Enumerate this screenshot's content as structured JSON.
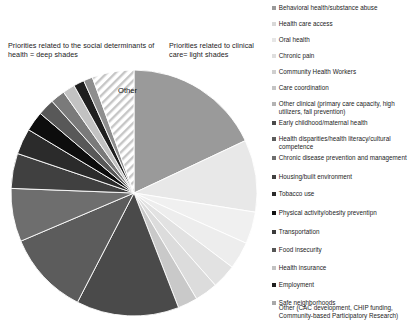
{
  "annotations": {
    "sdoh": "Priorities related to the social determinants of health = deep shades",
    "clinical": "Priorities related to clinical care= light shades"
  },
  "pie": {
    "other_label": "Other",
    "center_x": 134,
    "center_y": 193,
    "radius": 123
  },
  "chart_data": {
    "type": "pie",
    "title": "",
    "legend_position": "right",
    "grid": false,
    "annotations": [
      "Priorities related to the social determinants of health = deep shades",
      "Priorities related to clinical care= light shades"
    ],
    "slice_labels": [
      "Other"
    ],
    "categories": [
      "Behavioral health/substance abuse",
      "Health care access",
      "Oral health",
      "Chronic pain",
      "Community Health Workers",
      "Care coordination",
      "Other clinical (primary care capacity, high utilizers, fall prevention)",
      "Early childhood/maternal health",
      "Health disparities/health literacy/cultural competence",
      "Chronic disease prevention and management",
      "Housing/built environment",
      "Tobacco use",
      "Physical activity/obesity preventipn",
      "Transportation",
      "Food insecurity",
      "Health insurance",
      "Employment",
      "Safe neighborhoods",
      "Other (CAC development, CHIP funding, Community-based Participatory Research)"
    ],
    "values": [
      18.0,
      9.5,
      4.2,
      3.6,
      3.2,
      3.0,
      2.6,
      13.5,
      11.0,
      7.0,
      4.6,
      3.4,
      2.6,
      2.2,
      1.9,
      1.6,
      1.4,
      1.2,
      5.5
    ],
    "colors": [
      "#9a9a9a",
      "#e8e8e8",
      "#f0f0f0",
      "#ededed",
      "#e2e2e2",
      "#dcdcdc",
      "#c9c9c9",
      "#4a4a4a",
      "#5c5c5c",
      "#6e6e6e",
      "#404040",
      "#2b2b2b",
      "#0d0d0d",
      "#585858",
      "#7a7a7a",
      "#c2c2c2",
      "#1f1f1f",
      "#8e8e8e",
      "#ffffff"
    ],
    "hatched_slices": [
      "Other (CAC development, CHIP funding, Community-based Participatory Research)"
    ]
  },
  "legend": {
    "items": [
      {
        "label": "Behavioral health/substance abuse",
        "color": "#9a9a9a",
        "top": 4,
        "hatch": false
      },
      {
        "label": "Health care access",
        "color": "#d8d8d8",
        "top": 20,
        "hatch": false
      },
      {
        "label": "Oral health",
        "color": "#e6e6e6",
        "top": 36,
        "hatch": false
      },
      {
        "label": "Chronic pain",
        "color": "#dedede",
        "top": 52,
        "hatch": false
      },
      {
        "label": "Community Health Workers",
        "color": "#cfcfcf",
        "top": 68,
        "hatch": false
      },
      {
        "label": "Care coordination",
        "color": "#c4c4c4",
        "top": 84,
        "hatch": false
      },
      {
        "label": "Other clinical (primary care capacity, high utilizers, fall prevention)",
        "color": "#b3b3b3",
        "top": 100,
        "hatch": false
      },
      {
        "label": "Early childhood/maternal health",
        "color": "#4a4a4a",
        "top": 119,
        "hatch": false
      },
      {
        "label": "Health disparities/health literacy/cultural competence",
        "color": "#5c5c5c",
        "top": 135,
        "hatch": false
      },
      {
        "label": "Chronic disease prevention and management",
        "color": "#6e6e6e",
        "top": 154,
        "hatch": false
      },
      {
        "label": "Housing/built environment",
        "color": "#404040",
        "top": 173,
        "hatch": false
      },
      {
        "label": "Tobacco use",
        "color": "#2b2b2b",
        "top": 190,
        "hatch": false
      },
      {
        "label": "Physical activity/obesity preventipn",
        "color": "#121212",
        "top": 209,
        "hatch": false
      },
      {
        "label": "Transportation",
        "color": "#3a3a3a",
        "top": 228,
        "hatch": false
      },
      {
        "label": "Food insecurity",
        "color": "#555555",
        "top": 246,
        "hatch": false
      },
      {
        "label": "Health insurance",
        "color": "#c2c2c2",
        "top": 264,
        "hatch": false
      },
      {
        "label": "Employment",
        "color": "#1f1f1f",
        "top": 281,
        "hatch": false
      },
      {
        "label": "Safe neighborhoods",
        "color": "#a8a8a8",
        "top": 299,
        "hatch": false
      },
      {
        "label": "Other (CAC development, CHIP funding, Community-based Participatory Research)",
        "color": "#ffffff",
        "top": 304,
        "hatch": true
      }
    ]
  }
}
